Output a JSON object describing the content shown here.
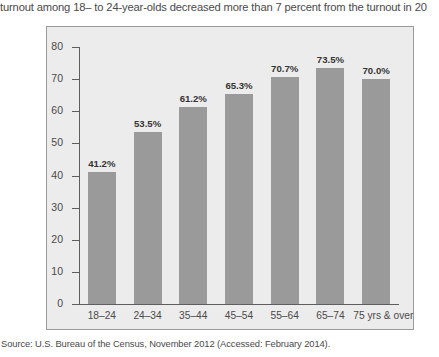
{
  "body_text": "turnout among 18– to 24-year-olds decreased more than 7 percent from the turnout in 20",
  "source_note": "Source: U.S. Bureau of the Census, November 2012 (Accessed: February 2014).",
  "colors": {
    "bar": "#9a9a9a",
    "plot_background": "#ececec",
    "frame_border": "#9b9b9b",
    "axis": "#5e5e5e",
    "text": "#4a4a4a"
  },
  "chart_data": {
    "type": "bar",
    "title": "",
    "xlabel": "",
    "ylabel": "",
    "ylim": [
      0,
      80
    ],
    "yticks": [
      0,
      10,
      20,
      30,
      40,
      50,
      60,
      70,
      80
    ],
    "grid": false,
    "legend": "none",
    "categories": [
      "18–24",
      "24–34",
      "35–44",
      "45–54",
      "55–64",
      "65–74",
      "75 yrs & over"
    ],
    "values": [
      41.2,
      53.5,
      61.2,
      65.3,
      70.7,
      73.5,
      70.0
    ],
    "data_labels": [
      "41.2%",
      "53.5%",
      "61.2%",
      "65.3%",
      "70.7%",
      "73.5%",
      "70.0%"
    ]
  }
}
